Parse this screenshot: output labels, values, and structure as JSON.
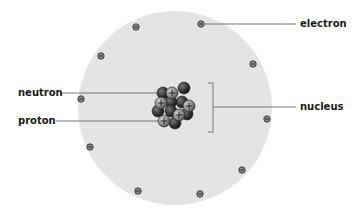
{
  "labels": {
    "electron": "electron",
    "neutron": "neutron",
    "proton": "proton",
    "nucleus": "nucleus"
  },
  "colors": {
    "electron_cloud": "#e4e4e4",
    "electron_fill": "#8a8a8a",
    "neutron_fill": "#3a3a3a",
    "proton_fill": "#9a9a9a",
    "leader_line": "#777777",
    "text": "#1a1a1a"
  },
  "atom": {
    "cx": 175,
    "cy": 108,
    "r": 97
  },
  "electrons": [
    {
      "x": 201,
      "y": 24
    },
    {
      "x": 136,
      "y": 27
    },
    {
      "x": 101,
      "y": 56
    },
    {
      "x": 253,
      "y": 64
    },
    {
      "x": 81,
      "y": 99
    },
    {
      "x": 267,
      "y": 119
    },
    {
      "x": 90,
      "y": 147
    },
    {
      "x": 242,
      "y": 170
    },
    {
      "x": 138,
      "y": 191
    },
    {
      "x": 200,
      "y": 194
    }
  ],
  "nucleus_particles": [
    {
      "type": "neutron",
      "x": 184,
      "y": 88
    },
    {
      "type": "neutron",
      "x": 163,
      "y": 93
    },
    {
      "type": "neutron",
      "x": 182,
      "y": 102
    },
    {
      "type": "neutron",
      "x": 171,
      "y": 102
    },
    {
      "type": "neutron",
      "x": 158,
      "y": 111
    },
    {
      "type": "neutron",
      "x": 171,
      "y": 111
    },
    {
      "type": "neutron",
      "x": 187,
      "y": 114
    },
    {
      "type": "neutron",
      "x": 175,
      "y": 123
    },
    {
      "type": "proton",
      "x": 172,
      "y": 93
    },
    {
      "type": "proton",
      "x": 161,
      "y": 103
    },
    {
      "type": "proton",
      "x": 189,
      "y": 106
    },
    {
      "type": "proton",
      "x": 179,
      "y": 115
    },
    {
      "type": "proton",
      "x": 164,
      "y": 121
    }
  ]
}
